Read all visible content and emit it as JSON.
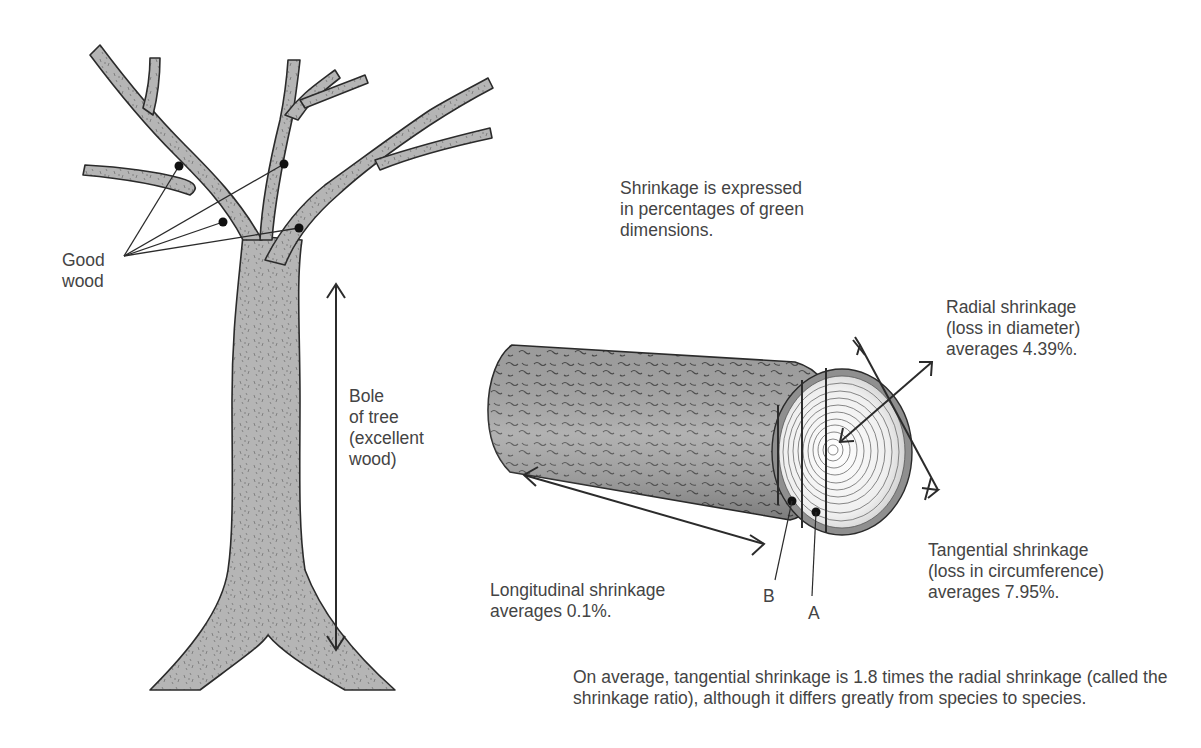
{
  "figure": {
    "colors": {
      "background": "#ffffff",
      "tree_fill": "#b3b3b3",
      "bark_fill": "#9c9c9c",
      "endgrain_fill": "#f2f2f2",
      "line": "#2b2b2b",
      "text": "#444444"
    },
    "tree": {
      "good_wood_label": [
        "Good",
        "wood"
      ],
      "good_wood_marker_count": 4,
      "bole_label": [
        "Bole",
        "of tree",
        "(excellent",
        "wood)"
      ],
      "bole_arrow_icon": "double-headed-vertical-arrow"
    },
    "log": {
      "intro": [
        "Shrinkage is expressed",
        "in percentages of green",
        "dimensions."
      ],
      "radial": {
        "label": [
          "Radial shrinkage",
          "(loss in diameter)",
          "averages 4.39%."
        ],
        "value": "4.39%",
        "arrow_icon": "double-headed-diagonal-arrow"
      },
      "tangential": {
        "label": [
          "Tangential shrinkage",
          "(loss in circumference)",
          "averages 7.95%."
        ],
        "value": "7.95%",
        "arrow_icon": "tangent-line-arrow"
      },
      "longitudinal": {
        "label": [
          "Longitudinal shrinkage",
          "averages 0.1%."
        ],
        "value": "0.1%",
        "arrow_icon": "double-headed-horizontal-arrow"
      },
      "markers": {
        "b": "B",
        "a": "A"
      }
    },
    "footnote": [
      "On average, tangential shrinkage is 1.8 times the radial shrinkage (called the",
      "shrinkage ratio), although it differs greatly from species to species."
    ]
  }
}
